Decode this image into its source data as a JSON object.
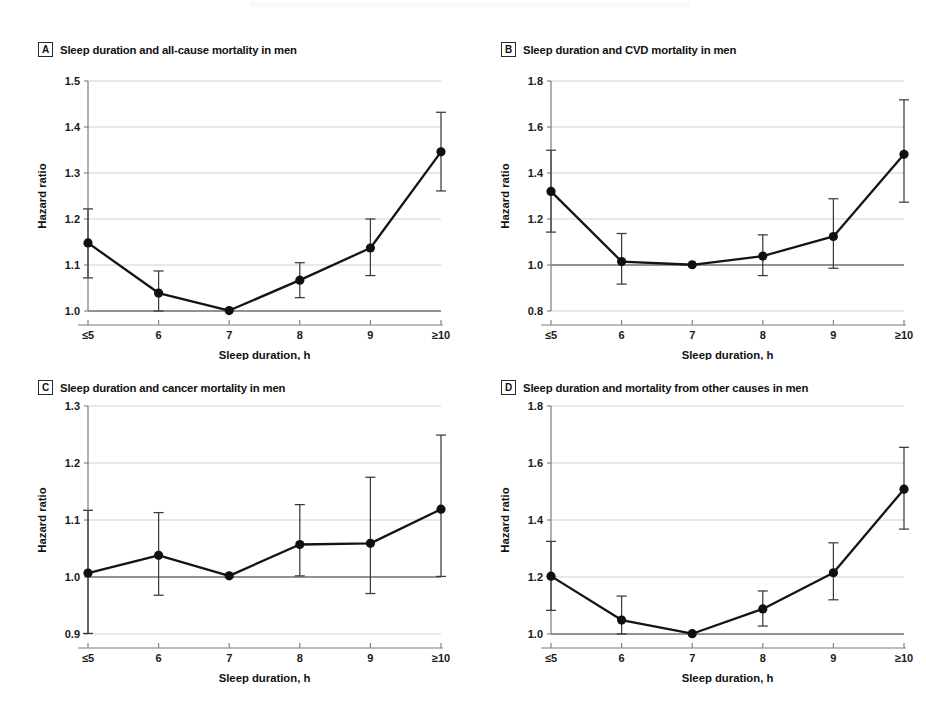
{
  "figure": {
    "shared_xlabel": "Sleep duration, h",
    "shared_ylabel": "Hazard ratio",
    "categories": [
      "≤5",
      "6",
      "7",
      "8",
      "9",
      "≥10"
    ],
    "reference_line": 1.0,
    "marker_color": "#101010",
    "line_color": "#141414",
    "grid_color": "#c9c9cf",
    "reference_color": "#6e6e73"
  },
  "chart_data": [
    {
      "type": "line",
      "panel": "A",
      "title": "Sleep duration and all-cause mortality in men",
      "xlabel": "Sleep duration, h",
      "ylabel": "Hazard ratio",
      "categories": [
        "≤5",
        "6",
        "7",
        "8",
        "9",
        "≥10"
      ],
      "values": [
        1.148,
        1.039,
        1.001,
        1.067,
        1.137,
        1.346
      ],
      "ci_lower": [
        1.072,
        0.992,
        1.001,
        1.029,
        1.077,
        1.261
      ],
      "ci_upper": [
        1.222,
        1.087,
        1.001,
        1.105,
        1.2,
        1.432
      ],
      "yticks": [
        1.0,
        1.1,
        1.2,
        1.3,
        1.4,
        1.5
      ],
      "ytick_labels": [
        "1.0",
        "1.1",
        "1.2",
        "1.3",
        "1.4",
        "1.5"
      ],
      "ylim": [
        1.0,
        1.5
      ],
      "grid": true,
      "legend": "none"
    },
    {
      "type": "line",
      "panel": "B",
      "title": "Sleep duration and CVD mortality in men",
      "xlabel": "Sleep duration, h",
      "ylabel": "Hazard ratio",
      "categories": [
        "≤5",
        "6",
        "7",
        "8",
        "9",
        "≥10"
      ],
      "values": [
        1.32,
        1.015,
        1.001,
        1.039,
        1.124,
        1.481
      ],
      "ci_lower": [
        1.143,
        0.917,
        1.001,
        0.954,
        0.986,
        1.273
      ],
      "ci_upper": [
        1.499,
        1.137,
        1.001,
        1.131,
        1.288,
        1.718
      ],
      "yticks": [
        0.8,
        1.0,
        1.2,
        1.4,
        1.6,
        1.8
      ],
      "ytick_labels": [
        "0.8",
        "1.0",
        "1.2",
        "1.4",
        "1.6",
        "1.8"
      ],
      "ylim": [
        0.8,
        1.8
      ],
      "grid": true,
      "legend": "none"
    },
    {
      "type": "line",
      "panel": "C",
      "title": "Sleep duration and cancer mortality in men",
      "xlabel": "Sleep duration, h",
      "ylabel": "Hazard ratio",
      "categories": [
        "≤5",
        "6",
        "7",
        "8",
        "9",
        "≥10"
      ],
      "values": [
        1.007,
        1.038,
        1.002,
        1.057,
        1.059,
        1.119
      ],
      "ci_lower": [
        0.901,
        0.968,
        1.002,
        1.002,
        0.971,
        1.001
      ],
      "ci_upper": [
        1.117,
        1.113,
        1.002,
        1.127,
        1.175,
        1.249
      ],
      "yticks": [
        0.9,
        1.0,
        1.1,
        1.2,
        1.3
      ],
      "ytick_labels": [
        "0.9",
        "1.0",
        "1.1",
        "1.2",
        "1.3"
      ],
      "ylim": [
        0.9,
        1.3
      ],
      "grid": true,
      "legend": "none"
    },
    {
      "type": "line",
      "panel": "D",
      "title": "Sleep duration and mortality from other causes in men",
      "xlabel": "Sleep duration, h",
      "ylabel": "Hazard ratio",
      "categories": [
        "≤5",
        "6",
        "7",
        "8",
        "9",
        "≥10"
      ],
      "values": [
        1.203,
        1.049,
        1.001,
        1.088,
        1.215,
        1.508
      ],
      "ci_lower": [
        1.083,
        0.979,
        1.001,
        1.028,
        1.12,
        1.368
      ],
      "ci_upper": [
        1.325,
        1.133,
        1.001,
        1.151,
        1.32,
        1.655
      ],
      "yticks": [
        1.0,
        1.2,
        1.4,
        1.6,
        1.8
      ],
      "ytick_labels": [
        "1.0",
        "1.2",
        "1.4",
        "1.6",
        "1.8"
      ],
      "ylim": [
        1.0,
        1.8
      ],
      "grid": true,
      "legend": "none"
    }
  ]
}
